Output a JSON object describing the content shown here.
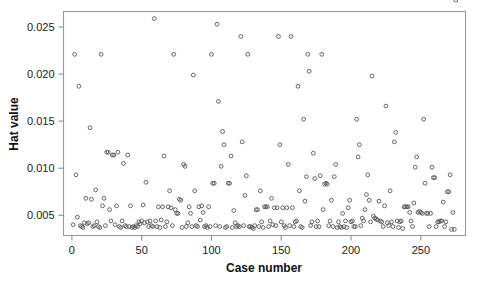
{
  "chart_data": {
    "type": "scatter",
    "title": "",
    "xlabel": "Case number",
    "ylabel": "Hat value",
    "xlim": [
      -6,
      282
    ],
    "ylim": [
      0.00285,
      0.02665
    ],
    "grid": false,
    "legend": null,
    "marker": "open-circle",
    "marker_color": "#555555",
    "xticks": [
      0,
      50,
      100,
      150,
      200,
      250
    ],
    "xtick_labels": [
      "0",
      "50",
      "100",
      "150",
      "200",
      "250"
    ],
    "yticks": [
      0.005,
      0.01,
      0.015,
      0.02,
      0.025
    ],
    "ytick_labels": [
      "0.005",
      "0.010",
      "0.015",
      "0.020",
      "0.025"
    ],
    "n_points": 275,
    "x": [
      1,
      2,
      3,
      4,
      5,
      6,
      7,
      8,
      9,
      10,
      11,
      12,
      13,
      14,
      15,
      16,
      17,
      18,
      19,
      20,
      21,
      22,
      23,
      24,
      25,
      26,
      27,
      28,
      29,
      30,
      31,
      32,
      33,
      34,
      35,
      36,
      37,
      38,
      39,
      40,
      41,
      42,
      43,
      44,
      45,
      46,
      47,
      48,
      49,
      50,
      51,
      52,
      53,
      54,
      55,
      56,
      57,
      58,
      59,
      60,
      61,
      62,
      63,
      64,
      65,
      66,
      67,
      68,
      69,
      70,
      71,
      72,
      73,
      74,
      75,
      76,
      77,
      78,
      79,
      80,
      81,
      82,
      83,
      84,
      85,
      86,
      87,
      88,
      89,
      90,
      91,
      92,
      93,
      94,
      95,
      96,
      97,
      98,
      99,
      100,
      101,
      102,
      103,
      104,
      105,
      106,
      107,
      108,
      109,
      110,
      111,
      112,
      113,
      114,
      115,
      116,
      117,
      118,
      119,
      120,
      121,
      122,
      123,
      124,
      125,
      126,
      127,
      128,
      129,
      130,
      131,
      132,
      133,
      134,
      135,
      136,
      137,
      138,
      139,
      140,
      141,
      142,
      143,
      144,
      145,
      146,
      147,
      148,
      149,
      150,
      151,
      152,
      153,
      154,
      155,
      156,
      157,
      158,
      159,
      160,
      161,
      162,
      163,
      164,
      165,
      166,
      167,
      168,
      169,
      170,
      171,
      172,
      173,
      174,
      175,
      176,
      177,
      178,
      179,
      180,
      181,
      182,
      183,
      184,
      185,
      186,
      187,
      188,
      189,
      190,
      191,
      192,
      193,
      194,
      195,
      196,
      197,
      198,
      199,
      200,
      201,
      202,
      203,
      204,
      205,
      206,
      207,
      208,
      209,
      210,
      211,
      212,
      213,
      214,
      215,
      216,
      217,
      218,
      219,
      220,
      221,
      222,
      223,
      224,
      225,
      226,
      227,
      228,
      229,
      230,
      231,
      232,
      233,
      234,
      235,
      236,
      237,
      238,
      239,
      240,
      241,
      242,
      243,
      244,
      245,
      246,
      247,
      248,
      249,
      250,
      251,
      252,
      253,
      254,
      255,
      256,
      257,
      258,
      259,
      260,
      261,
      262,
      263,
      264,
      265,
      266,
      267,
      268,
      269,
      270,
      271,
      272,
      273,
      274,
      275
    ],
    "y": [
      0.004,
      0.0221,
      0.0093,
      0.0048,
      0.0187,
      0.0039,
      0.0038,
      0.0037,
      0.0042,
      0.0068,
      0.0041,
      0.0042,
      0.0143,
      0.0067,
      0.0038,
      0.0039,
      0.0077,
      0.0043,
      0.0038,
      0.0037,
      0.0221,
      0.006,
      0.0068,
      0.0039,
      0.0117,
      0.0117,
      0.0056,
      0.0044,
      0.0114,
      0.0114,
      0.004,
      0.006,
      0.0117,
      0.0038,
      0.0037,
      0.0044,
      0.0105,
      0.0039,
      0.0038,
      0.0114,
      0.0038,
      0.006,
      0.0037,
      0.0038,
      0.0037,
      0.0039,
      0.0038,
      0.0043,
      0.0041,
      0.0044,
      0.0061,
      0.0042,
      0.0085,
      0.0043,
      0.0038,
      0.0044,
      0.0039,
      0.0038,
      0.0259,
      0.0044,
      0.0038,
      0.0059,
      0.0037,
      0.0045,
      0.0059,
      0.0113,
      0.0038,
      0.0043,
      0.0059,
      0.0076,
      0.0058,
      0.0039,
      0.0221,
      0.0056,
      0.0052,
      0.0052,
      0.0067,
      0.0066,
      0.0037,
      0.0104,
      0.0102,
      0.0038,
      0.0042,
      0.0059,
      0.0052,
      0.0038,
      0.0199,
      0.0076,
      0.0039,
      0.0038,
      0.0059,
      0.0045,
      0.006,
      0.0053,
      0.0038,
      0.0039,
      0.0037,
      0.0059,
      0.0038,
      0.0221,
      0.0084,
      0.0084,
      0.0039,
      0.0253,
      0.0171,
      0.0038,
      0.0102,
      0.0139,
      0.0125,
      0.0037,
      0.0038,
      0.0084,
      0.0084,
      0.0113,
      0.0037,
      0.0055,
      0.0042,
      0.0038,
      0.0039,
      0.0038,
      0.024,
      0.0128,
      0.0039,
      0.0071,
      0.0092,
      0.0221,
      0.0038,
      0.0038,
      0.0037,
      0.0036,
      0.0039,
      0.0056,
      0.0056,
      0.0038,
      0.0076,
      0.0043,
      0.0037,
      0.0059,
      0.0059,
      0.0059,
      0.0038,
      0.0044,
      0.0068,
      0.004,
      0.0058,
      0.0039,
      0.0058,
      0.024,
      0.0125,
      0.0043,
      0.0058,
      0.0039,
      0.0037,
      0.0058,
      0.0104,
      0.0039,
      0.024,
      0.0058,
      0.0038,
      0.0043,
      0.0044,
      0.0187,
      0.0076,
      0.0038,
      0.0037,
      0.0152,
      0.0065,
      0.0091,
      0.0221,
      0.0203,
      0.0039,
      0.0043,
      0.0116,
      0.0089,
      0.0038,
      0.0044,
      0.0038,
      0.0092,
      0.0221,
      0.0056,
      0.0083,
      0.0084,
      0.0083,
      0.0039,
      0.0044,
      0.0066,
      0.0038,
      0.0091,
      0.0104,
      0.0037,
      0.0043,
      0.0038,
      0.0037,
      0.0052,
      0.0038,
      0.0044,
      0.0037,
      0.0058,
      0.0066,
      0.0043,
      0.0044,
      0.0038,
      0.0038,
      0.0152,
      0.0112,
      0.0125,
      0.0039,
      0.0047,
      0.0044,
      0.0056,
      0.0072,
      0.0093,
      0.0066,
      0.0043,
      0.0198,
      0.0049,
      0.0047,
      0.0046,
      0.0045,
      0.0065,
      0.0044,
      0.0043,
      0.0038,
      0.006,
      0.0166,
      0.0042,
      0.0039,
      0.0076,
      0.0043,
      0.0038,
      0.0128,
      0.0138,
      0.0044,
      0.0037,
      0.0043,
      0.0044,
      0.0036,
      0.0059,
      0.0059,
      0.0059,
      0.0059,
      0.0053,
      0.0044,
      0.0038,
      0.0063,
      0.0101,
      0.0112,
      0.0053,
      0.0054,
      0.0053,
      0.0052,
      0.0152,
      0.0084,
      0.0052,
      0.0052,
      0.0038,
      0.0052,
      0.0101,
      0.009,
      0.009,
      0.0038,
      0.0043,
      0.0043,
      0.0044,
      0.0044,
      0.0064,
      0.0038,
      0.0043,
      0.0075,
      0.0075,
      0.0093,
      0.0035,
      0.0053,
      0.0035
    ]
  },
  "axes": {
    "ylabel": "Hat value",
    "xlabel": "Case number"
  }
}
